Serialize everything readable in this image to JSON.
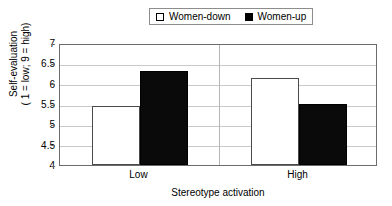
{
  "chart_data": {
    "type": "bar",
    "title": "",
    "xlabel": "Stereotype activation",
    "ylabel_line1": "Self-evaluation",
    "ylabel_line2": "( 1 = low; 9 = high)",
    "categories": [
      "Low",
      "High"
    ],
    "series": [
      {
        "name": "Women-down",
        "values": [
          5.45,
          6.15
        ],
        "color": "#ffffff"
      },
      {
        "name": "Women-up",
        "values": [
          6.3,
          5.5
        ],
        "color": "#000000"
      }
    ],
    "ylim": [
      4,
      7
    ],
    "yticks": [
      4,
      4.5,
      5,
      5.5,
      6,
      6.5,
      7
    ],
    "ytick_labels": [
      "4",
      "4.5",
      "5",
      "5.5",
      "6",
      "6.5",
      "7"
    ],
    "grid": true,
    "legend_position": "top-center"
  },
  "legend": {
    "items": [
      {
        "label": "Women-down",
        "style": "hollow"
      },
      {
        "label": "Women-up",
        "style": "filled"
      }
    ]
  }
}
